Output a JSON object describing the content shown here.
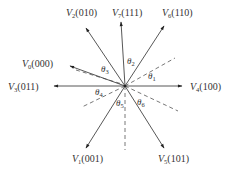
{
  "diagram": {
    "type": "space-vector-diagram",
    "center": [
      125,
      86
    ],
    "vectors": [
      {
        "id": "V0",
        "name": "V",
        "sub": "0",
        "code": "(000)",
        "end": [
          70,
          66
        ],
        "label_pos": [
          22,
          67
        ]
      },
      {
        "id": "V1",
        "name": "V",
        "sub": "1",
        "code": "(001)",
        "end": [
          86,
          148
        ],
        "label_pos": [
          72,
          162
        ]
      },
      {
        "id": "V2",
        "name": "V",
        "sub": "2",
        "code": "(010)",
        "end": [
          86,
          28
        ],
        "label_pos": [
          66,
          16
        ]
      },
      {
        "id": "V3",
        "name": "V",
        "sub": "3",
        "code": "(011)",
        "end": [
          54,
          86
        ],
        "label_pos": [
          8,
          90
        ]
      },
      {
        "id": "V4",
        "name": "V",
        "sub": "4",
        "code": "(100)",
        "end": [
          182,
          86
        ],
        "label_pos": [
          190,
          90
        ]
      },
      {
        "id": "V5",
        "name": "V",
        "sub": "5",
        "code": "(101)",
        "end": [
          164,
          148
        ],
        "label_pos": [
          158,
          162
        ]
      },
      {
        "id": "V6",
        "name": "V",
        "sub": "6",
        "code": "(110)",
        "end": [
          164,
          26
        ],
        "label_pos": [
          162,
          16
        ]
      },
      {
        "id": "V7",
        "name": "V",
        "sub": "7",
        "code": "(111)",
        "end": [
          121,
          22
        ],
        "label_pos": [
          112,
          16
        ]
      }
    ],
    "angles": [
      {
        "id": "theta1",
        "name": "θ",
        "sub": "1",
        "pos": [
          148,
          79
        ]
      },
      {
        "id": "theta2",
        "name": "θ",
        "sub": "2",
        "pos": [
          127,
          64
        ]
      },
      {
        "id": "theta3",
        "name": "θ",
        "sub": "3",
        "pos": [
          101,
          72
        ]
      },
      {
        "id": "theta4",
        "name": "θ",
        "sub": "4",
        "pos": [
          95,
          95
        ]
      },
      {
        "id": "theta5",
        "name": "θ",
        "sub": "5",
        "pos": [
          116,
          106
        ]
      },
      {
        "id": "theta6",
        "name": "θ",
        "sub": "6",
        "pos": [
          137,
          105
        ]
      }
    ],
    "dashed_lines": [
      {
        "id": "dash-upper-right",
        "end": [
          175,
          58
        ]
      },
      {
        "id": "dash-vertical-down",
        "end": [
          125,
          150
        ]
      },
      {
        "id": "dash-lower-left",
        "end": [
          82,
          107
        ]
      },
      {
        "id": "dash-lower-right",
        "end": [
          178,
          111
        ]
      },
      {
        "id": "dash-v0-parallel",
        "start": [
          76,
          70
        ],
        "end": [
          122,
          84
        ]
      }
    ]
  }
}
